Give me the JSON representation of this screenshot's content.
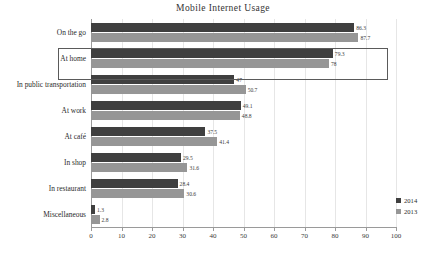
{
  "chart_data": {
    "type": "bar",
    "orientation": "horizontal",
    "title": "Mobile Internet Usage",
    "xlabel": "",
    "ylabel": "",
    "xlim": [
      0,
      100
    ],
    "xticks": [
      "0",
      "10",
      "20",
      "30",
      "40",
      "50",
      "60",
      "70",
      "80",
      "90",
      "100"
    ],
    "grid": true,
    "legend_position": "right-bottom",
    "categories": [
      "On the go",
      "At home",
      "In public transportation",
      "At work",
      "At café",
      "In shop",
      "In restaurant",
      "Miscellaneous"
    ],
    "series": [
      {
        "name": "2014",
        "color": "#3f3f3f",
        "values": [
          86.3,
          79.3,
          47,
          49.1,
          37.5,
          29.5,
          28.4,
          1.3
        ],
        "labels": [
          "86.3",
          "79.3",
          "47",
          "49.1",
          "37.5",
          "29.5",
          "28.4",
          "1.3"
        ]
      },
      {
        "name": "2013",
        "color": "#969696",
        "values": [
          87.7,
          78,
          50.7,
          48.8,
          41.4,
          31.6,
          30.6,
          2.8
        ],
        "labels": [
          "87.7",
          "78",
          "50.7",
          "48.8",
          "41.4",
          "31.6",
          "30.6",
          "2.8"
        ]
      }
    ],
    "annotations": [
      {
        "type": "highlight-rectangle",
        "target_category": "At home",
        "color": "#5a5a5a"
      }
    ]
  }
}
